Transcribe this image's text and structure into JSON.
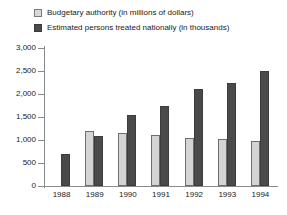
{
  "chart_data": {
    "type": "bar",
    "title": "",
    "subtitle": "",
    "xlabel": "",
    "ylabel": "",
    "ylim": [
      0,
      3000
    ],
    "yticks": [
      "0",
      "500",
      "1,000",
      "1,500",
      "2,000",
      "2,500",
      "3,000"
    ],
    "ytick_values": [
      0,
      500,
      1000,
      1500,
      2000,
      2500,
      3000
    ],
    "grid": false,
    "legend_position": "top-left",
    "categories": [
      "1988",
      "1989",
      "1990",
      "1991",
      "1992",
      "1993",
      "1994"
    ],
    "series": [
      {
        "name": "Budgetary authority (in millions of dollars)",
        "color": "#d4d4d4",
        "border_color": "#6e6e6e",
        "values": [
          null,
          1200,
          1150,
          1100,
          1050,
          1020,
          970
        ]
      },
      {
        "name": "Estimated persons treated nationally (in thousands)",
        "color": "#4a4a4a",
        "border_color": "#3c3c3c",
        "values": [
          700,
          1080,
          1550,
          1750,
          2100,
          2250,
          2500
        ]
      }
    ]
  },
  "legend": {
    "items": [
      {
        "label": "Budgetary authority (in millions of dollars)",
        "swatch": "light"
      },
      {
        "label": "Estimated persons treated nationally (in thousands)",
        "swatch": "dark"
      }
    ]
  }
}
